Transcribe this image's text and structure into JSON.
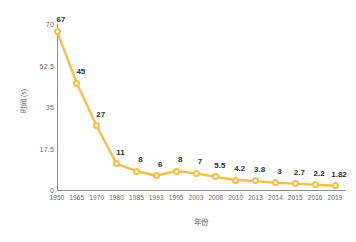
{
  "chart_data": {
    "type": "line",
    "title": "",
    "xlabel": "年份",
    "ylabel": "时间 (s)",
    "categories": [
      "1950",
      "1965",
      "1970",
      "1980",
      "1985",
      "1993",
      "1995",
      "2003",
      "2008",
      "2010",
      "2013",
      "2014",
      "2015",
      "2016",
      "2019"
    ],
    "values": [
      67,
      45,
      27,
      11,
      8,
      6,
      8,
      7,
      5.5,
      4.2,
      3.8,
      3,
      2.7,
      2.2,
      1.82
    ],
    "point_labels": [
      "67",
      "45",
      "27",
      "11",
      "8",
      "6",
      "8",
      "7",
      "5.5",
      "4.2",
      "3.8",
      "3",
      "2.7",
      "2.2",
      "1.82"
    ],
    "ylim": [
      0,
      70
    ],
    "yticks": [
      0,
      17.5,
      35,
      52.5,
      70
    ],
    "ytick_labels": [
      "0",
      "17.5",
      "35",
      "52.5",
      "70"
    ],
    "grid": false,
    "legend": false,
    "series_color": "#F0C04A",
    "marker_fill": "#ffffff",
    "axis_color": "#8d8d8d",
    "label_color": "#2f2f2f",
    "tick_color": "#6a6a6a",
    "background": "#ffffff"
  }
}
